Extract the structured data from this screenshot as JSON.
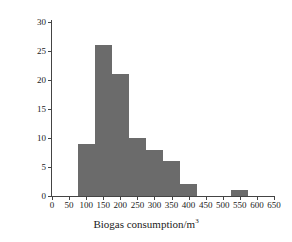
{
  "chart_data": {
    "type": "bar",
    "title": "",
    "subtitle": "",
    "xlabel": "Biogas consumption/m",
    "xlabel_superscript": "3",
    "ylabel": "User number",
    "xlim": [
      0,
      650
    ],
    "ylim": [
      0,
      30
    ],
    "grid": false,
    "legend": null,
    "bar_color": "#6b6b6b",
    "axis_color": "#444444",
    "background_color": "#ffffff",
    "bin_width": 50,
    "x_ticks": [
      0,
      50,
      100,
      150,
      200,
      250,
      300,
      350,
      400,
      450,
      500,
      550,
      600,
      650
    ],
    "x_tick_labels": [
      "0",
      "50",
      "100",
      "150",
      "200",
      "250",
      "300",
      "350",
      "400",
      "450",
      "500",
      "550",
      "600",
      "650"
    ],
    "y_ticks": [
      0,
      5,
      10,
      15,
      20,
      25,
      30
    ],
    "y_tick_labels": [
      "0",
      "5",
      "10",
      "15",
      "20",
      "25",
      "30"
    ],
    "bins": [
      {
        "start": 75,
        "end": 125,
        "center": 100,
        "value": 9
      },
      {
        "start": 125,
        "end": 175,
        "center": 150,
        "value": 26
      },
      {
        "start": 175,
        "end": 225,
        "center": 200,
        "value": 21
      },
      {
        "start": 225,
        "end": 275,
        "center": 250,
        "value": 10
      },
      {
        "start": 275,
        "end": 325,
        "center": 300,
        "value": 8
      },
      {
        "start": 325,
        "end": 375,
        "center": 350,
        "value": 6
      },
      {
        "start": 375,
        "end": 425,
        "center": 400,
        "value": 2
      },
      {
        "start": 525,
        "end": 575,
        "center": 550,
        "value": 1
      }
    ],
    "categories": [
      "100",
      "150",
      "200",
      "250",
      "300",
      "350",
      "400",
      "550"
    ],
    "values": [
      9,
      26,
      21,
      10,
      8,
      6,
      2,
      1
    ]
  }
}
